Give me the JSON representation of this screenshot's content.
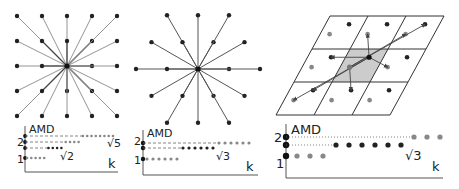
{
  "panels": [
    {
      "id": "square-lattice",
      "plot": {
        "ylabel": "AMD",
        "xlabel": "k",
        "yticks": [
          "1",
          "2"
        ],
        "annotations": [
          "√2",
          "√5"
        ]
      }
    },
    {
      "id": "hexagonal-lattice",
      "plot": {
        "ylabel": "AMD",
        "xlabel": "k",
        "yticks": [
          "1",
          "2"
        ],
        "annotations": [
          "√3"
        ]
      }
    },
    {
      "id": "periodic-set",
      "plot": {
        "ylabel": "AMD",
        "xlabel": "k",
        "yticks": [
          "1",
          "2"
        ],
        "annotations": [
          "√3"
        ]
      }
    }
  ],
  "chart_data": [
    {
      "type": "line",
      "title": "Square lattice AMD",
      "xlabel": "k",
      "ylabel": "AMD",
      "levels": [
        {
          "value": "1",
          "points": 5,
          "color": "#888888"
        },
        {
          "value": "√2",
          "points": 4,
          "color": "#222222"
        },
        {
          "value": "2",
          "points": 4,
          "color": "#888888"
        },
        {
          "value": "√5",
          "points": 8,
          "color": "#888888"
        }
      ]
    },
    {
      "type": "line",
      "title": "Hexagonal lattice AMD",
      "xlabel": "k",
      "ylabel": "AMD",
      "levels": [
        {
          "value": "1",
          "points": 6,
          "color": "#888888"
        },
        {
          "value": "√3",
          "points": 6,
          "color": "#222222"
        },
        {
          "value": "2",
          "points": 6,
          "color": "#888888"
        }
      ]
    },
    {
      "type": "line",
      "title": "Periodic set AMD",
      "xlabel": "k",
      "ylabel": "AMD",
      "levels": [
        {
          "value": "1",
          "points": 3,
          "color": "#888888"
        },
        {
          "value": "√3",
          "points": 6,
          "color": "#222222"
        },
        {
          "value": "2",
          "points": 3,
          "color": "#888888"
        }
      ]
    }
  ]
}
